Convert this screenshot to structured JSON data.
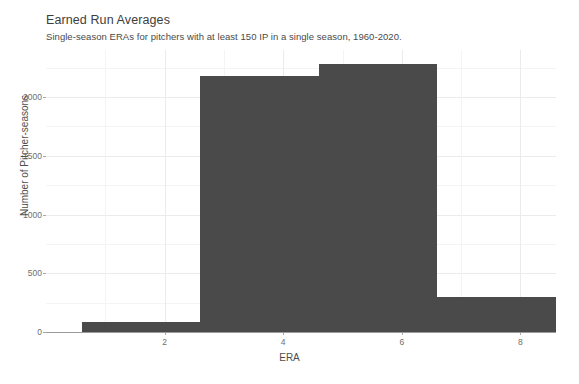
{
  "figure": {
    "title": "Earned Run Averages",
    "subtitle": "Single-season ERAs for pitchers with at least 150 IP in a single season, 1960-2020.",
    "background_color": "#ffffff",
    "bar_color": "#4a4a4a",
    "grid_color": "#ebebeb"
  },
  "chart_data": {
    "type": "bar",
    "chart_subtype": "histogram",
    "title": "Earned Run Averages",
    "subtitle": "Single-season ERAs for pitchers with at least 150 IP in a single season, 1960-2020.",
    "xlabel": "ERA",
    "ylabel": "Number of Pitcher-seasons",
    "xlim": [
      0,
      8.6
    ],
    "ylim": [
      0,
      2400
    ],
    "xticks": [
      2,
      4,
      6,
      8
    ],
    "xtick_labels": [
      "2",
      "4",
      "6",
      "8"
    ],
    "yticks": [
      0,
      500,
      1000,
      1500,
      2000
    ],
    "ytick_labels": [
      "0",
      "500",
      "1000",
      "1500",
      "2000"
    ],
    "grid": true,
    "legend": false,
    "bin_width": 2,
    "bin_edges": [
      0.6,
      2.6,
      4.6,
      6.6,
      8.6
    ],
    "categories": [
      "0.6-2.6",
      "2.6-4.6",
      "4.6-6.6",
      "6.6-8.6"
    ],
    "values": [
      85,
      2180,
      2280,
      300
    ],
    "bars": [
      {
        "left": 0.6,
        "right": 2.6,
        "value": 85
      },
      {
        "left": 2.6,
        "right": 4.6,
        "value": 2180
      },
      {
        "left": 4.6,
        "right": 6.6,
        "value": 2280
      },
      {
        "left": 6.6,
        "right": 8.6,
        "value": 300
      }
    ]
  }
}
